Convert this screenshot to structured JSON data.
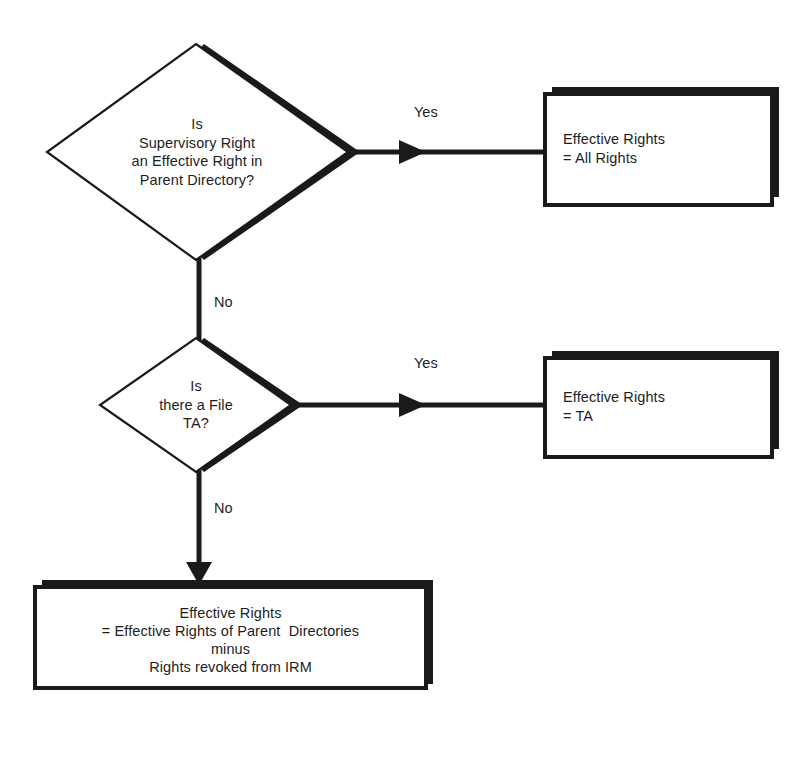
{
  "diagram": {
    "type": "flowchart",
    "colors": {
      "ink": "#1a1a1a",
      "shadow": "#1a1a1a",
      "background": "#ffffff"
    },
    "nodes": [
      {
        "id": "decision-supervisory",
        "shape": "diamond",
        "lines": [
          "Is",
          "Supervisory Right",
          "an Effective Right in",
          "Parent Directory?"
        ],
        "text": "Is\nSupervisory Right\nan Effective Right in\nParent Directory?"
      },
      {
        "id": "result-all-rights",
        "shape": "rectangle",
        "lines": [
          "Effective Rights",
          "= All Rights"
        ],
        "text": "Effective Rights\n= All Rights"
      },
      {
        "id": "decision-file-ta",
        "shape": "diamond",
        "lines": [
          "Is",
          "there a File",
          "TA?"
        ],
        "text": "Is\nthere a File\nTA?"
      },
      {
        "id": "result-ta",
        "shape": "rectangle",
        "lines": [
          "Effective Rights",
          "= TA"
        ],
        "text": "Effective Rights\n= TA"
      },
      {
        "id": "result-inherited",
        "shape": "rectangle",
        "lines": [
          "Effective Rights",
          "= Effective Rights of Parent  Directories",
          "minus",
          "Rights revoked from IRM"
        ],
        "text": "Effective Rights\n= Effective Rights of Parent  Directories\nminus\nRights revoked from IRM"
      }
    ],
    "edges": [
      {
        "id": "edge-sup-yes",
        "label": "Yes",
        "from": "decision-supervisory",
        "to": "result-all-rights"
      },
      {
        "id": "edge-sup-no",
        "label": "No",
        "from": "decision-supervisory",
        "to": "decision-file-ta"
      },
      {
        "id": "edge-ta-yes",
        "label": "Yes",
        "from": "decision-file-ta",
        "to": "result-ta"
      },
      {
        "id": "edge-ta-no",
        "label": "No",
        "from": "decision-file-ta",
        "to": "result-inherited"
      }
    ]
  }
}
